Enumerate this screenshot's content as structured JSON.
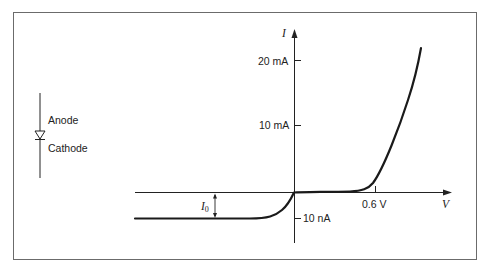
{
  "diagram": {
    "symbol": {
      "anode_label": "Anode",
      "cathode_label": "Cathode"
    },
    "axes": {
      "x_label": "V",
      "y_label": "I",
      "y_ticks": [
        "20 mA",
        "10 mA",
        "10 nA"
      ],
      "x_ticks": [
        "0.6 V"
      ]
    },
    "annotation": {
      "saturation_current_symbol": "I",
      "saturation_current_subscript": "0"
    },
    "colors": {
      "line": "#1a1a1a",
      "frame": "#6b6b6b",
      "background": "#ffffff"
    }
  }
}
